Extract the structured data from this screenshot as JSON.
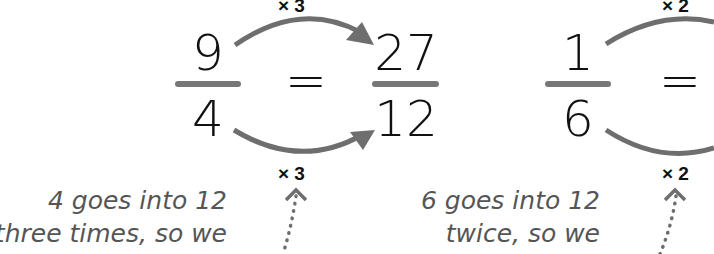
{
  "equations": [
    {
      "left": {
        "numerator": "9",
        "denominator": "4"
      },
      "equals": "=",
      "right": {
        "numerator": "27",
        "denominator": "12"
      },
      "top_multiplier": "× 3",
      "bottom_multiplier": "× 3",
      "note_lines": [
        "4 goes into 12",
        "three times, so we"
      ]
    },
    {
      "left": {
        "numerator": "1",
        "denominator": "6"
      },
      "equals": "=",
      "top_multiplier": "× 2",
      "bottom_multiplier": "× 2",
      "note_lines": [
        "6 goes into 12",
        "twice, so we"
      ]
    }
  ],
  "colors": {
    "arrow": "#6e6e6e",
    "fraction_bar": "#777777",
    "text": "#111111",
    "note": "#555555"
  }
}
